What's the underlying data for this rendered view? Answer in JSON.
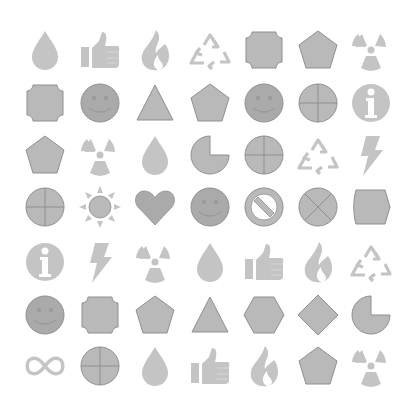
{
  "canvas": {
    "width": 400,
    "height": 415,
    "background": "#ffffff"
  },
  "colors": {
    "fill": "#b9b9b9",
    "fill_dark": "#aaaaaa",
    "stroke": "#8f8f8f",
    "light": "#c4c4c4",
    "white": "#ffffff"
  },
  "layout": {
    "columns_x": [
      45,
      100,
      155,
      210,
      264,
      318,
      371
    ],
    "rows_y": [
      50,
      103,
      155,
      207,
      262,
      315,
      366
    ]
  },
  "grid": [
    [
      "drop",
      "thumbs-up",
      "flame",
      "recycle",
      "notched-square",
      "pentagon",
      "radiation"
    ],
    [
      "notched-square",
      "smiley",
      "triangle",
      "pentagon",
      "smiley",
      "circle-cross",
      "info"
    ],
    [
      "pentagon",
      "radiation",
      "drop",
      "pie",
      "circle-cross",
      "recycle",
      "lightning"
    ],
    [
      "circle-cross",
      "sun",
      "heart",
      "smiley",
      "no-symbol",
      "circle-x",
      "barrel"
    ],
    [
      "info",
      "lightning",
      "radiation",
      "drop",
      "thumbs-up",
      "flame",
      "recycle"
    ],
    [
      "smiley",
      "notched-square",
      "pentagon",
      "triangle",
      "hexagon",
      "diamond",
      "pie"
    ],
    [
      "infinity",
      "circle-cross",
      "drop",
      "thumbs-up",
      "flame",
      "pentagon",
      "radiation"
    ]
  ]
}
